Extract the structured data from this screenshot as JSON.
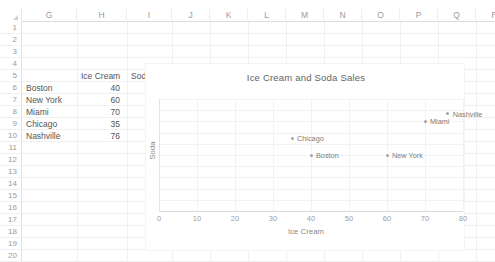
{
  "sheet": {
    "column_headers": [
      "G",
      "H",
      "I",
      "J",
      "K",
      "L",
      "M",
      "N",
      "O",
      "P",
      "Q",
      "R"
    ],
    "row_headers": [
      "1",
      "2",
      "3",
      "4",
      "5",
      "6",
      "7",
      "8",
      "9",
      "10",
      "11",
      "12",
      "13",
      "14",
      "15",
      "16",
      "17",
      "18",
      "19",
      "20"
    ],
    "table": {
      "header_row": 5,
      "headers": [
        "",
        "Ice Cream",
        "Soda"
      ],
      "rows": [
        {
          "row": 6,
          "city": "Boston",
          "ice_cream": "40",
          "soda": "50"
        },
        {
          "row": 7,
          "city": "New York",
          "ice_cream": "60",
          "soda": "50"
        },
        {
          "row": 8,
          "city": "Miami",
          "ice_cream": "70",
          "soda": "80"
        },
        {
          "row": 9,
          "city": "Chicago",
          "ice_cream": "35",
          "soda": "65"
        },
        {
          "row": 10,
          "city": "Nashville",
          "ice_cream": "76",
          "soda": "87"
        }
      ]
    }
  },
  "chart_data": {
    "type": "scatter",
    "title": "Ice Cream and Soda Sales",
    "xlabel": "Ice Cream",
    "ylabel": "Soda",
    "xlim": [
      0,
      80
    ],
    "ylim": [
      0,
      100
    ],
    "xticks": [
      "0",
      "10",
      "20",
      "30",
      "40",
      "50",
      "60",
      "70",
      "80"
    ],
    "yticks": [],
    "grid": true,
    "legend": "none",
    "marker_color": "#a6a6a6",
    "points": [
      {
        "label": "Boston",
        "x": 40,
        "y": 50
      },
      {
        "label": "New York",
        "x": 60,
        "y": 50
      },
      {
        "label": "Miami",
        "x": 70,
        "y": 80
      },
      {
        "label": "Chicago",
        "x": 35,
        "y": 65
      },
      {
        "label": "Nashville",
        "x": 76,
        "y": 87
      }
    ]
  }
}
